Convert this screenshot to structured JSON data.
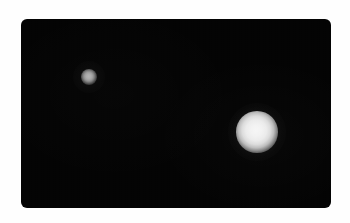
{
  "image": {
    "kind": "astronomical-observation-frame",
    "width": 350,
    "height": 223,
    "page_background_color": "#fefefe",
    "description": "Two unresolved luminous objects on a black sky field"
  },
  "sky_field": {
    "name": "sky-field",
    "background_color": "#040404",
    "x": 21,
    "y": 19,
    "width": 310,
    "height": 189,
    "corner_radius": 6
  },
  "objects": [
    {
      "id": "primary",
      "role": "bright-object",
      "center_x": 257,
      "center_y": 132,
      "radius": 13,
      "core_color": "#f4f4f4",
      "peak_brightness": "#f6f6f6",
      "relative_size": "large",
      "halo_radius": 29
    },
    {
      "id": "secondary",
      "role": "faint-object",
      "center_x": 89,
      "center_y": 77,
      "radius": 5,
      "core_color": "#a8a8a8",
      "peak_brightness": "#b4b4b4",
      "relative_size": "small",
      "halo_radius": 16
    }
  ],
  "icons": {
    "primary_object_icon": "bright-disk-icon",
    "secondary_object_icon": "faint-disk-icon"
  }
}
